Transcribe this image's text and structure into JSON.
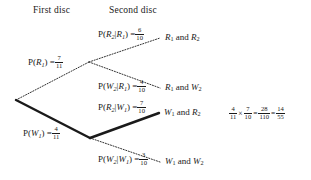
{
  "diagram": {
    "title_row": {
      "first": "First disc",
      "second": "Second disc"
    },
    "branch_labels": {
      "p_r1_text": "P(",
      "p_r1_var": "R",
      "p_r1_sub": "1",
      "p_r1_close": ") =",
      "p_r1_num": "7",
      "p_r1_den": "11",
      "p_w1_text": "P(",
      "p_w1_var": "W",
      "p_w1_sub": "1",
      "p_w1_close": ") =",
      "p_w1_num": "4",
      "p_w1_den": "11",
      "p_r2_r1_open": "P(",
      "p_r2_r1_var": "R",
      "p_r2_r1_sub": "2",
      "p_r2_r1_bar": "|",
      "p_r2_r1_cond": "R",
      "p_r2_r1_condsub": "1",
      "p_r2_r1_close": ") =",
      "p_r2_r1_num": "6",
      "p_r2_r1_den": "10",
      "p_w2_r1_open": "P(",
      "p_w2_r1_var": "W",
      "p_w2_r1_sub": "2",
      "p_w2_r1_bar": "|",
      "p_w2_r1_cond": "R",
      "p_w2_r1_condsub": "1",
      "p_w2_r1_close": ") =",
      "p_w2_r1_num": "4",
      "p_w2_r1_den": "10",
      "p_r2_w1_open": "P(",
      "p_r2_w1_var": "R",
      "p_r2_w1_sub": "2",
      "p_r2_w1_bar": "|",
      "p_r2_w1_cond": "W",
      "p_r2_w1_condsub": "1",
      "p_r2_w1_close": ") =",
      "p_r2_w1_num": "7",
      "p_r2_w1_den": "10",
      "p_w2_w1_open": "P(",
      "p_w2_w1_var": "W",
      "p_w2_w1_sub": "2",
      "p_w2_w1_bar": "|",
      "p_w2_w1_cond": "W",
      "p_w2_w1_condsub": "1",
      "p_w2_w1_close": ") =",
      "p_w2_w1_num": "3",
      "p_w2_w1_den": "10"
    },
    "outcomes": {
      "o1_a": "R",
      "o1_asub": "1",
      "o1_and": "and",
      "o1_b": "R",
      "o1_bsub": "2",
      "o2_a": "R",
      "o2_asub": "1",
      "o2_and": "and",
      "o2_b": "W",
      "o2_bsub": "2",
      "o3_a": "W",
      "o3_asub": "1",
      "o3_and": "and",
      "o3_b": "R",
      "o3_bsub": "2",
      "o4_a": "W",
      "o4_asub": "1",
      "o4_and": "and",
      "o4_b": "W",
      "o4_bsub": "2"
    },
    "calculation": {
      "f1_num": "4",
      "f1_den": "11",
      "times": "×",
      "f2_num": "7",
      "f2_den": "10",
      "eq1": "=",
      "f3_num": "28",
      "f3_den": "110",
      "eq2": "=",
      "f4_num": "14",
      "f4_den": "55"
    },
    "style": {
      "ink": "#1a1a1a",
      "background": "#ffffff",
      "highlight_stroke_width": "2.4",
      "dotted_stroke_width": "0.9"
    }
  }
}
